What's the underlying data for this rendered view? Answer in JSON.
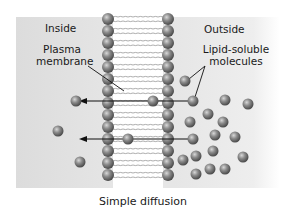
{
  "labels": {
    "inside": "Inside",
    "outside": "Outside",
    "plasma_membrane_line1": "Plasma",
    "plasma_membrane_line2": "membrane",
    "lipid_soluble_line1": "Lipid-soluble",
    "lipid_soluble_line2": "molecules"
  },
  "caption": "Simple diffusion",
  "colors": {
    "background_panel": "#e2e2e2",
    "head_fill": "#7a7a7a",
    "molecule_fill": "#8a8a8a",
    "arrow": "#111111",
    "text": "#1a1a1a"
  },
  "icons": {
    "phospholipid_head": "gray-sphere",
    "molecule": "gray-sphere",
    "diffusion_arrow": "left-arrow"
  },
  "diagram": {
    "membrane": {
      "left_heads_x": 108,
      "right_heads_x": 168,
      "top_y": 19,
      "bottom_y": 184,
      "head_spacing": 12
    },
    "arrows": [
      {
        "from_x": 192,
        "to_x": 79,
        "y": 101
      },
      {
        "from_x": 192,
        "to_x": 79,
        "y": 139
      }
    ],
    "molecules_inside": [
      {
        "x": 76,
        "y": 101
      },
      {
        "x": 58,
        "y": 131
      },
      {
        "x": 80,
        "y": 162
      }
    ],
    "molecules_in_membrane": [
      {
        "x": 153,
        "y": 101
      },
      {
        "x": 128,
        "y": 139
      }
    ],
    "molecules_outside": [
      {
        "x": 185,
        "y": 81
      },
      {
        "x": 193,
        "y": 101
      },
      {
        "x": 225,
        "y": 100
      },
      {
        "x": 248,
        "y": 104
      },
      {
        "x": 208,
        "y": 114
      },
      {
        "x": 190,
        "y": 122
      },
      {
        "x": 223,
        "y": 122
      },
      {
        "x": 235,
        "y": 137
      },
      {
        "x": 193,
        "y": 139
      },
      {
        "x": 215,
        "y": 135
      },
      {
        "x": 213,
        "y": 151
      },
      {
        "x": 183,
        "y": 160
      },
      {
        "x": 196,
        "y": 156
      },
      {
        "x": 243,
        "y": 157
      },
      {
        "x": 225,
        "y": 169
      },
      {
        "x": 196,
        "y": 174
      },
      {
        "x": 210,
        "y": 169
      }
    ]
  }
}
